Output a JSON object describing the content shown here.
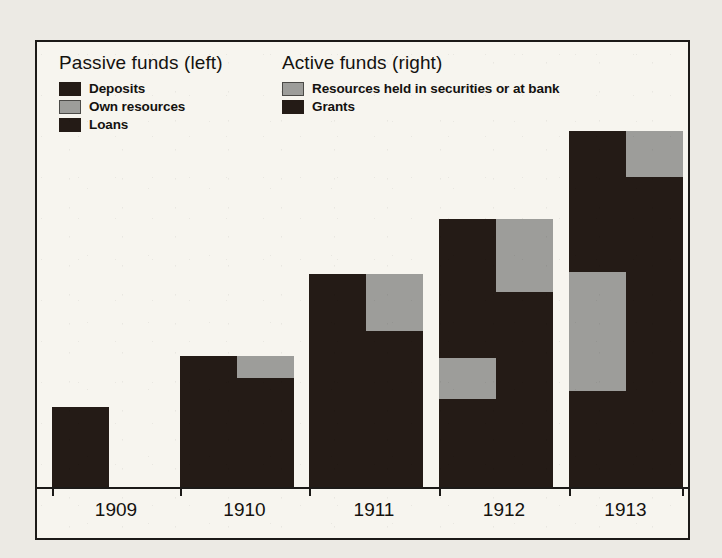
{
  "figure": {
    "background_color": "#eceae4",
    "plate_color": "#f7f5ef",
    "frame_color": "#1c1a18"
  },
  "legend": {
    "passive": {
      "title": "Passive funds (left)",
      "items": [
        {
          "label": "Deposits",
          "color": "#241b16",
          "swatch": "dark"
        },
        {
          "label": "Own resources",
          "color": "#9d9d9a",
          "swatch": "gray"
        },
        {
          "label": "Loans",
          "color": "#241b16",
          "swatch": "dark"
        }
      ]
    },
    "active": {
      "title": "Active funds (right)",
      "items": [
        {
          "label": "Resources held in securities or at bank",
          "color": "#9d9d9a",
          "swatch": "gray"
        },
        {
          "label": "Grants",
          "color": "#241b16",
          "swatch": "dark"
        }
      ]
    }
  },
  "chart_data": {
    "type": "bar",
    "subtype": "paired-stacked",
    "title": "",
    "xlabel": "",
    "ylabel": "",
    "grid": false,
    "legend_position": "top-inside",
    "categories": [
      "1909",
      "1910",
      "1911",
      "1912",
      "1913"
    ],
    "axis": {
      "y_visible": false,
      "x_visible": true,
      "ylim": [
        0,
        100
      ],
      "baseline_value": 0
    },
    "colors": {
      "dark": "#241b16",
      "gray": "#9d9d9a"
    },
    "groups": [
      {
        "category": "1909",
        "bars": [
          {
            "side": "left",
            "name": "Passive funds",
            "total": 16.4,
            "segments": [
              {
                "series": "Deposits",
                "color": "dark",
                "value": 16.4
              }
            ]
          },
          {
            "side": "right",
            "name": "Active funds",
            "total": 0,
            "segments": []
          }
        ]
      },
      {
        "category": "1910",
        "bars": [
          {
            "side": "left",
            "name": "Passive funds",
            "total": 26.9,
            "segments": [
              {
                "series": "Deposits",
                "color": "dark",
                "value": 26.9
              }
            ]
          },
          {
            "side": "right",
            "name": "Active funds",
            "total": 26.9,
            "segments": [
              {
                "series": "Resources held in securities or at bank",
                "color": "gray",
                "value": 4.5
              },
              {
                "series": "Grants",
                "color": "dark",
                "value": 22.4
              }
            ]
          }
        ]
      },
      {
        "category": "1911",
        "bars": [
          {
            "side": "left",
            "name": "Passive funds",
            "total": 43.7,
            "segments": [
              {
                "series": "Deposits",
                "color": "dark",
                "value": 43.7
              }
            ]
          },
          {
            "side": "right",
            "name": "Active funds",
            "total": 43.7,
            "segments": [
              {
                "series": "Resources held in securities or at bank",
                "color": "gray",
                "value": 11.7
              },
              {
                "series": "Grants",
                "color": "dark",
                "value": 32.0
              }
            ]
          }
        ]
      },
      {
        "category": "1912",
        "bars": [
          {
            "side": "left",
            "name": "Passive funds",
            "total": 55.0,
            "segments": [
              {
                "series": "Deposits",
                "color": "dark",
                "value": 28.5
              },
              {
                "series": "Own resources",
                "color": "gray",
                "value": 8.5
              },
              {
                "series": "Loans",
                "color": "dark",
                "value": 18.0
              }
            ]
          },
          {
            "side": "right",
            "name": "Active funds",
            "total": 55.0,
            "segments": [
              {
                "series": "Resources held in securities or at bank",
                "color": "gray",
                "value": 15.0
              },
              {
                "series": "Grants",
                "color": "dark",
                "value": 40.0
              }
            ]
          }
        ]
      },
      {
        "category": "1913",
        "bars": [
          {
            "side": "left",
            "name": "Passive funds",
            "total": 73.0,
            "segments": [
              {
                "series": "Deposits",
                "color": "dark",
                "value": 28.9
              },
              {
                "series": "Own resources",
                "color": "gray",
                "value": 24.4
              },
              {
                "series": "Loans",
                "color": "dark",
                "value": 19.7
              }
            ]
          },
          {
            "side": "right",
            "name": "Active funds",
            "total": 73.0,
            "segments": [
              {
                "series": "Resources held in securities or at bank",
                "color": "gray",
                "value": 9.4
              },
              {
                "series": "Grants",
                "color": "dark",
                "value": 63.6
              }
            ]
          }
        ]
      }
    ]
  }
}
